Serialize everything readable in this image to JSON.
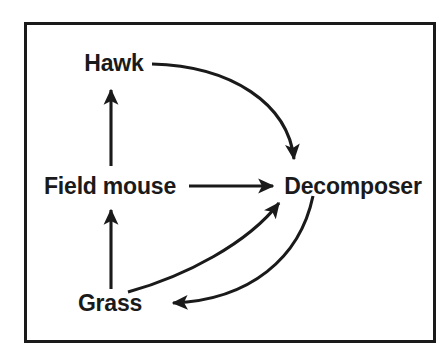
{
  "figure": {
    "background_color": "#ffffff",
    "ink_color": "#1a1a1a",
    "frame": {
      "name": "diagram-border",
      "x": 24,
      "y": 22,
      "width": 412,
      "height": 321,
      "stroke_width": 3
    }
  },
  "nodes": [
    {
      "id": "hawk",
      "label": "Hawk",
      "x": 114,
      "y": 63
    },
    {
      "id": "field_mouse",
      "label": "Field mouse",
      "x": 110,
      "y": 186
    },
    {
      "id": "decomposer",
      "label": "Decomposer",
      "x": 353,
      "y": 186
    },
    {
      "id": "grass",
      "label": "Grass",
      "x": 110,
      "y": 303
    }
  ],
  "edges": [
    {
      "id": "field-mouse-to-hawk",
      "from": "field_mouse",
      "to": "hawk",
      "style": "straight",
      "direction": "up",
      "path": "M 111 166 L 111 90"
    },
    {
      "id": "grass-to-field-mouse",
      "from": "grass",
      "to": "field_mouse",
      "style": "straight",
      "direction": "up",
      "path": "M 111 289 L 111 210"
    },
    {
      "id": "field-mouse-to-decomposer",
      "from": "field_mouse",
      "to": "decomposer",
      "style": "straight",
      "direction": "right",
      "path": "M 189 186 L 273 186"
    },
    {
      "id": "hawk-to-decomposer",
      "from": "hawk",
      "to": "decomposer",
      "style": "curved",
      "direction": "down-right",
      "path": "M 152 64 C 232 66 288 104 294 159"
    },
    {
      "id": "grass-to-decomposer",
      "from": "grass",
      "to": "decomposer",
      "style": "curved",
      "direction": "up-right",
      "path": "M 128 292 C 186 276 248 243 279 203"
    },
    {
      "id": "decomposer-to-grass",
      "from": "decomposer",
      "to": "grass",
      "style": "curved",
      "direction": "down-left",
      "path": "M 313 196 C 300 258 250 300 173 303"
    }
  ]
}
